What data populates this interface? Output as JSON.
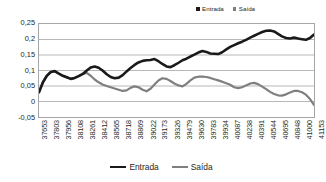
{
  "legend_top": {
    "items": [
      {
        "label": "Entrada",
        "color": "#1a1a1a",
        "marker": "square-marker"
      },
      {
        "label": "Saída",
        "color": "#7f7f7f",
        "marker": "square-marker"
      }
    ]
  },
  "legend_bottom": {
    "items": [
      {
        "label": "Entrada",
        "color": "#1a1a1a",
        "marker": "line-marker"
      },
      {
        "label": "Saída",
        "color": "#7f7f7f",
        "marker": "line-marker"
      }
    ]
  },
  "chart_data": {
    "type": "line",
    "title": "",
    "subtitle": "",
    "xlabel": "",
    "ylabel": "",
    "grid": true,
    "legend_position": "top-right and bottom-center",
    "ylim": [
      -0.05,
      0.25
    ],
    "ytick_labels": [
      "0,25",
      "0,2",
      "0,15",
      "0,1",
      "0,05",
      "0",
      "-0,05"
    ],
    "ytick_values": [
      0.25,
      0.2,
      0.15,
      0.1,
      0.05,
      0,
      -0.05
    ],
    "decimal_separator": ",",
    "xtick_labels": [
      "37653",
      "37803",
      "37956",
      "38108",
      "38261",
      "38412",
      "38565",
      "38718",
      "38869",
      "39022",
      "39173",
      "39326",
      "39479",
      "39630",
      "39783",
      "39934",
      "40087",
      "40238",
      "40391",
      "40544",
      "40695",
      "40848",
      "41000",
      "41153"
    ],
    "categories": [
      "37653",
      "37803",
      "37956",
      "38108",
      "38261",
      "38412",
      "38565",
      "38718",
      "38869",
      "39022",
      "39173",
      "39326",
      "39479",
      "39630",
      "39783",
      "39934",
      "40087",
      "40238",
      "40391",
      "40544",
      "40695",
      "40848",
      "41000",
      "41153"
    ],
    "x_range": [
      37653,
      41153
    ],
    "series": [
      {
        "name": "Entrada",
        "color": "#1a1a1a",
        "line_width": 2.6,
        "x": [
          37653,
          37703,
          37753,
          37803,
          37853,
          37906,
          37956,
          38006,
          38058,
          38108,
          38158,
          38211,
          38261,
          38311,
          38362,
          38412,
          38462,
          38515,
          38565,
          38615,
          38668,
          38718,
          38768,
          38818,
          38869,
          38919,
          38972,
          39022,
          39072,
          39123,
          39173,
          39223,
          39276,
          39326,
          39376,
          39429,
          39479,
          39529,
          39580,
          39630,
          39680,
          39733,
          39783,
          39833,
          39884,
          39934,
          39984,
          40037,
          40087,
          40137,
          40188,
          40238,
          40288,
          40341,
          40391,
          40441,
          40494,
          40544,
          40594,
          40645,
          40695,
          40745,
          40798,
          40848,
          40898,
          40951,
          41000,
          41050,
          41102,
          41153
        ],
        "values": [
          0.03,
          0.062,
          0.083,
          0.095,
          0.098,
          0.09,
          0.083,
          0.078,
          0.073,
          0.076,
          0.082,
          0.089,
          0.1,
          0.11,
          0.113,
          0.109,
          0.1,
          0.088,
          0.079,
          0.075,
          0.077,
          0.085,
          0.097,
          0.108,
          0.118,
          0.126,
          0.131,
          0.133,
          0.134,
          0.137,
          0.13,
          0.121,
          0.113,
          0.111,
          0.117,
          0.125,
          0.133,
          0.138,
          0.145,
          0.151,
          0.158,
          0.163,
          0.16,
          0.155,
          0.154,
          0.153,
          0.159,
          0.168,
          0.176,
          0.182,
          0.188,
          0.193,
          0.199,
          0.206,
          0.212,
          0.218,
          0.224,
          0.228,
          0.229,
          0.226,
          0.218,
          0.21,
          0.205,
          0.203,
          0.206,
          0.203,
          0.201,
          0.199,
          0.205,
          0.216
        ]
      },
      {
        "name": "Saída",
        "color": "#7f7f7f",
        "line_width": 2.2,
        "x": [
          37653,
          37703,
          37753,
          37803,
          37853,
          37906,
          37956,
          38006,
          38058,
          38108,
          38158,
          38211,
          38261,
          38311,
          38362,
          38412,
          38462,
          38515,
          38565,
          38615,
          38668,
          38718,
          38768,
          38818,
          38869,
          38919,
          38972,
          39022,
          39072,
          39123,
          39173,
          39223,
          39276,
          39326,
          39376,
          39429,
          39479,
          39529,
          39580,
          39630,
          39680,
          39733,
          39783,
          39833,
          39884,
          39934,
          39984,
          40037,
          40087,
          40137,
          40188,
          40238,
          40288,
          40341,
          40391,
          40441,
          40494,
          40544,
          40594,
          40645,
          40695,
          40745,
          40798,
          40848,
          40898,
          40951,
          41000,
          41050,
          41102,
          41153
        ],
        "values": [
          0.03,
          0.062,
          0.083,
          0.095,
          0.098,
          0.09,
          0.083,
          0.078,
          0.073,
          0.076,
          0.082,
          0.089,
          0.092,
          0.083,
          0.071,
          0.062,
          0.055,
          0.05,
          0.046,
          0.042,
          0.038,
          0.034,
          0.036,
          0.044,
          0.049,
          0.046,
          0.038,
          0.033,
          0.041,
          0.055,
          0.068,
          0.075,
          0.073,
          0.066,
          0.058,
          0.052,
          0.049,
          0.057,
          0.068,
          0.077,
          0.08,
          0.08,
          0.079,
          0.076,
          0.072,
          0.068,
          0.064,
          0.059,
          0.054,
          0.046,
          0.043,
          0.046,
          0.052,
          0.058,
          0.06,
          0.056,
          0.048,
          0.04,
          0.031,
          0.024,
          0.02,
          0.019,
          0.023,
          0.029,
          0.034,
          0.034,
          0.03,
          0.022,
          0.008,
          -0.011
        ]
      }
    ]
  }
}
